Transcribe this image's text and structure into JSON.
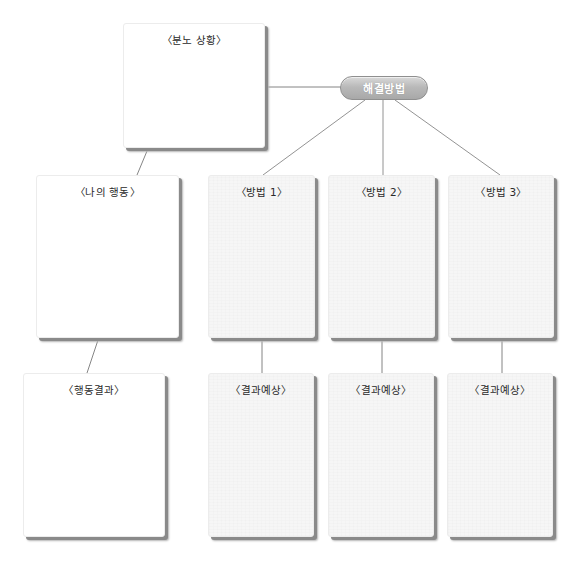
{
  "diagram": {
    "type": "anger-resolution-worksheet",
    "hub": {
      "label": "해결방법",
      "fill_top": "#d9d9d9",
      "fill_bottom": "#a8a8a8",
      "text_color": "#ffffff"
    },
    "situation": {
      "title": "〈분노 상황〉"
    },
    "my_action": {
      "title": "〈나의 행동〉"
    },
    "action_result": {
      "title": "〈행동결과〉"
    },
    "methods": [
      {
        "title": "〈방법 1〉",
        "result_title": "〈결과예상〉"
      },
      {
        "title": "〈방법 2〉",
        "result_title": "〈결과예상〉"
      },
      {
        "title": "〈방법 3〉",
        "result_title": "〈결과예상〉"
      }
    ],
    "colors": {
      "background": "#ffffff",
      "card": "#ffffff",
      "card_textured": "#f6f6f6",
      "shadow": "#8a8a8a",
      "connector": "#666666"
    }
  }
}
